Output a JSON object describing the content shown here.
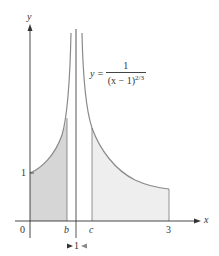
{
  "diagram": {
    "axes": {
      "x_label": "x",
      "y_label": "y",
      "origin_label": "0"
    },
    "ticks": {
      "y_one": "1",
      "x_b": "b",
      "x_c": "c",
      "x_three": "3"
    },
    "formula": {
      "lhs": "y =",
      "numerator": "1",
      "denominator_base": "(x − 1)",
      "denominator_exponent": "2/3"
    },
    "asymptote_label": "1",
    "colors": {
      "curve": "#8a8a8a",
      "axis": "#333333",
      "left_fill": "#d6d6d6",
      "right_fill": "#eeeeee",
      "arrow": "#555555"
    }
  }
}
